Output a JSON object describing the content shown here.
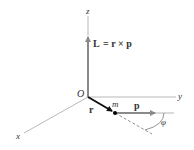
{
  "figure": {
    "colors": {
      "axis": "#888888",
      "vector_L": "#8a8a8a",
      "vector_p": "#8a8a8a",
      "vector_r": "#111111",
      "particle": "#000000",
      "text": "#333333"
    }
  },
  "axes": {
    "x_label": "x",
    "y_label": "y",
    "z_label": "z",
    "origin_label": "O"
  },
  "vectors": {
    "L_label": "L",
    "equation_rhs": "= r × p",
    "r_label": "r",
    "p_label": "p"
  },
  "particle": {
    "label": "m"
  },
  "angle": {
    "label": "φ"
  }
}
